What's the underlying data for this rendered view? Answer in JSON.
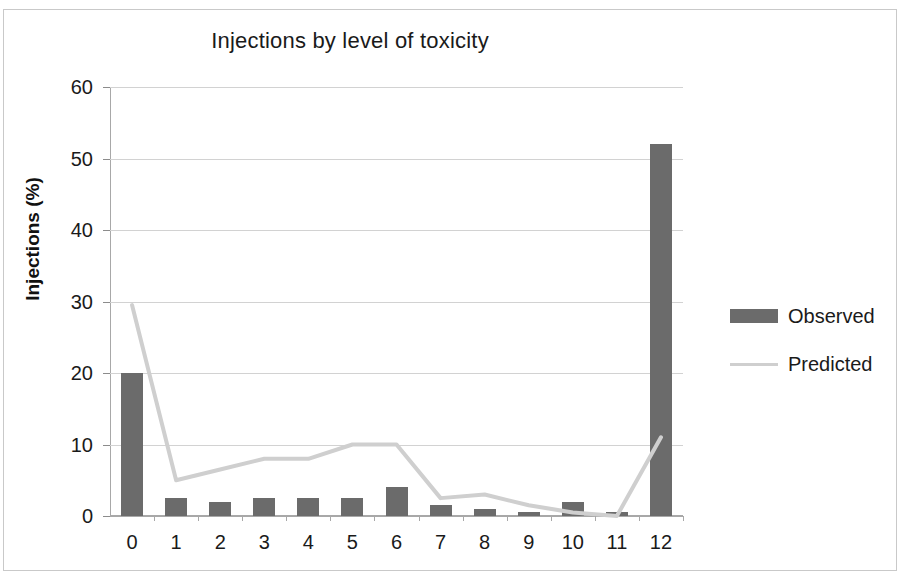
{
  "chart_data": {
    "type": "bar",
    "title": "Injections by level of toxicity",
    "xlabel": "",
    "ylabel": "Injections (%)",
    "categories": [
      "0",
      "1",
      "2",
      "3",
      "4",
      "5",
      "6",
      "7",
      "8",
      "9",
      "10",
      "11",
      "12"
    ],
    "ylim": [
      0,
      60
    ],
    "yticks": [
      0,
      10,
      20,
      30,
      40,
      50,
      60
    ],
    "grid": true,
    "legend_position": "right",
    "series": [
      {
        "name": "Observed",
        "type": "bar",
        "color": "#6b6b6b",
        "values": [
          20,
          2.5,
          2,
          2.5,
          2.5,
          2.5,
          4,
          1.5,
          1,
          0.5,
          2,
          0.5,
          52
        ]
      },
      {
        "name": "Predicted",
        "type": "line",
        "color": "#cfcfcf",
        "values": [
          29.5,
          5,
          6.5,
          8,
          8,
          10,
          10,
          2.5,
          3,
          1.5,
          0.5,
          0,
          11
        ]
      }
    ]
  },
  "legend": {
    "items": [
      {
        "label": "Observed",
        "marker": "bar-swatch"
      },
      {
        "label": "Predicted",
        "marker": "line-swatch"
      }
    ]
  }
}
